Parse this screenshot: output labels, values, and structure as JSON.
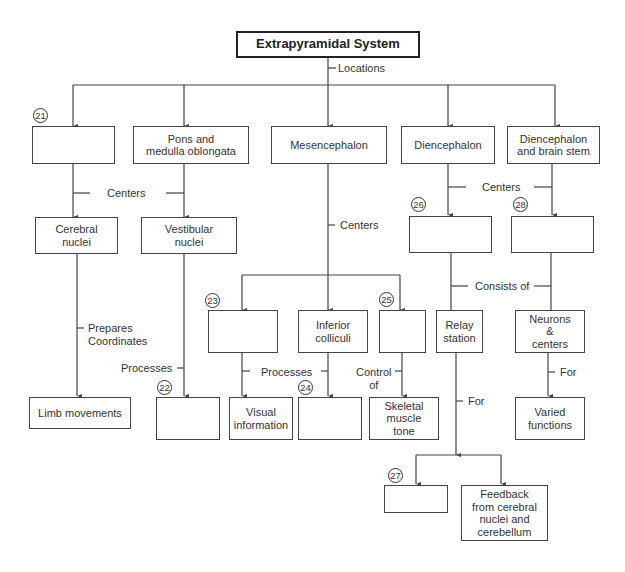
{
  "title": "Extrapyramidal System",
  "links": {
    "locations": "Locations",
    "centers_left": "Centers",
    "centers_mid": "Centers",
    "centers_right": "Centers",
    "prepares": "Prepares\nCoordinates",
    "processes_left": "Processes",
    "processes_mid": "Processes",
    "control_of": "Control\nof",
    "consists_of": "Consists of",
    "for_relay": "For",
    "for_neurons": "For"
  },
  "locations": {
    "blank_21": "",
    "pons": "Pons and\nmedulla oblongata",
    "mesencephalon": "Mesencephalon",
    "diencephalon": "Diencephalon",
    "dien_brainstem": "Diencephalon\nand brain stem"
  },
  "nodes": {
    "cerebral_nuclei": "Cerebral\nnuclei",
    "vestibular_nuclei": "Vestibular\nnuclei",
    "blank_26": "",
    "blank_28": "",
    "blank_23": "",
    "inferior_colliculi": "Inferior\ncolliculi",
    "blank_25": "",
    "relay_station": "Relay\nstation",
    "neurons_centers": "Neurons\n&\ncenters",
    "limb_movements": "Limb movements",
    "blank_22": "",
    "visual_information": "Visual\ninformation",
    "blank_24": "",
    "skeletal_muscle_tone": "Skeletal\nmuscle\ntone",
    "varied_functions": "Varied\nfunctions",
    "blank_27": "",
    "feedback": "Feedback\nfrom cerebral\nnuclei and\ncerebellum"
  },
  "numbers": {
    "n21": "21",
    "n22": "22",
    "n23": "23",
    "n24": "24",
    "n25": "25",
    "n26": "26",
    "n27": "27",
    "n28": "28"
  }
}
